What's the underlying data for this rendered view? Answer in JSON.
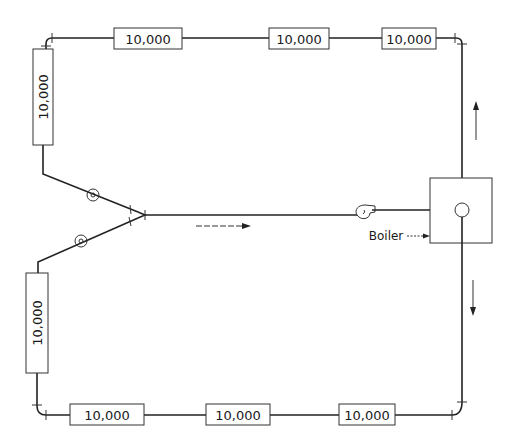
{
  "diagram": {
    "title": "",
    "top_loads": [
      {
        "label": "10,000"
      },
      {
        "label": "10,000"
      },
      {
        "label": "10,000"
      }
    ],
    "left_upper_load": {
      "label": "10,000"
    },
    "left_lower_load": {
      "label": "10,000"
    },
    "bottom_loads": [
      {
        "label": "10,000"
      },
      {
        "label": "10,000"
      },
      {
        "label": "10,000"
      }
    ],
    "boiler": {
      "label": "Boiler"
    },
    "flow_arrows": [
      "up",
      "down",
      "right"
    ],
    "colors": {
      "line": "#222222",
      "background": "#ffffff"
    }
  }
}
